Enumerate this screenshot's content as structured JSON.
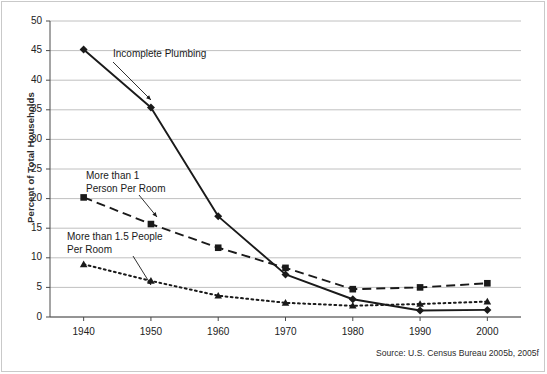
{
  "chart_data": {
    "type": "line",
    "title": "",
    "xlabel": "",
    "ylabel": "Percent of Total Households",
    "categories": [
      1940,
      1950,
      1960,
      1970,
      1980,
      1990,
      2000
    ],
    "xlim": [
      1935,
      2005
    ],
    "ylim": [
      0,
      50
    ],
    "y_ticks": [
      0,
      5,
      10,
      15,
      20,
      25,
      30,
      35,
      40,
      45,
      50
    ],
    "x_ticks": [
      1940,
      1950,
      1960,
      1970,
      1980,
      1990,
      2000
    ],
    "x_tick_labels": [
      "1940",
      "1950",
      "1960",
      "1970",
      "1980",
      "1990",
      "2000"
    ],
    "y_tick_labels": [
      "0",
      "5",
      "10",
      "15",
      "20",
      "25",
      "30",
      "35",
      "40",
      "45",
      "50"
    ],
    "grid": "horizontal",
    "legend_position": "inline-annotations",
    "series": [
      {
        "name": "Incomplete Plumbing",
        "style": "solid",
        "marker": "diamond",
        "color": "#1a1a1a",
        "values": [
          45.2,
          35.4,
          17.0,
          7.2,
          3.0,
          1.1,
          1.2
        ]
      },
      {
        "name": "More than 1 Person Per Room",
        "style": "dashed",
        "marker": "square",
        "color": "#1a1a1a",
        "values": [
          20.2,
          15.7,
          11.7,
          8.3,
          4.7,
          5.0,
          5.7
        ]
      },
      {
        "name": "More than 1.5 People Per Room",
        "style": "dotted",
        "marker": "triangle",
        "color": "#1a1a1a",
        "values": [
          8.9,
          6.1,
          3.6,
          2.4,
          1.9,
          2.2,
          2.6
        ]
      }
    ],
    "annotations": [
      {
        "id": "incomplete-plumbing",
        "text": "Incomplete Plumbing",
        "x": 113,
        "y": 48,
        "leader_from": [
          113,
          62
        ],
        "leader_to": [
          151,
          100
        ]
      },
      {
        "id": "more-than-1-person",
        "text": "More than 1\nPerson Per Room",
        "x": 86,
        "y": 170,
        "leader_from": [
          139,
          195
        ],
        "leader_to": [
          157,
          217
        ]
      },
      {
        "id": "more-than-1-5-people",
        "text": "More than 1.5 People\nPer Room",
        "x": 67,
        "y": 231,
        "leader_from": [
          133,
          256
        ],
        "leader_to": [
          151,
          285
        ]
      }
    ]
  },
  "source": {
    "note": "Source: U.S. Census Bureau 2005b, 2005f"
  }
}
